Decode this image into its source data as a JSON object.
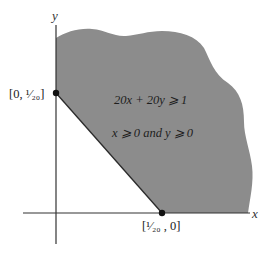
{
  "diagram": {
    "axes": {
      "x_label": "x",
      "y_label": "y"
    },
    "points": [
      {
        "label": "[0, ¹⁄₂₀]",
        "coords": [
          0,
          0.05
        ]
      },
      {
        "label": "[¹⁄₂₀ , 0]",
        "coords": [
          0.05,
          0
        ]
      }
    ],
    "region": {
      "inequality": "20x + 20y ⩾ 1",
      "constraint": "x ⩾ 0 and y ⩾ 0"
    },
    "colors": {
      "shade": "#8c8c8c",
      "axis": "#333333",
      "point": "#111111"
    }
  }
}
